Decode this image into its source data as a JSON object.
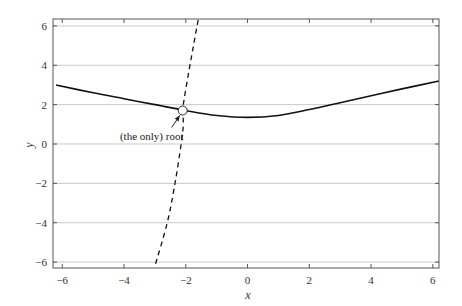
{
  "chart_data": {
    "type": "line",
    "title": "",
    "xlabel": "x",
    "ylabel": "y",
    "xlim": [
      -6.3,
      6.2
    ],
    "ylim": [
      -6.3,
      6.35
    ],
    "xticks": [
      -6,
      -4,
      -2,
      0,
      2,
      4,
      6
    ],
    "yticks": [
      -6,
      -4,
      -2,
      0,
      2,
      4,
      6
    ],
    "xtick_labels": [
      "−6",
      "−4",
      "−2",
      "0",
      "2",
      "4",
      "6"
    ],
    "ytick_labels": [
      "−6",
      "−4",
      "−2",
      "0",
      "2",
      "4",
      "6"
    ],
    "grid": {
      "horizontal": true,
      "vertical": false
    },
    "legend": null,
    "series": [
      {
        "name": "solid curve",
        "style": "solid",
        "x": [
          -6.2,
          -5,
          -4,
          -3,
          -2,
          -1,
          0,
          1,
          2,
          3,
          4,
          5,
          6.2
        ],
        "y": [
          3.0,
          2.6,
          2.3,
          2.0,
          1.7,
          1.45,
          1.35,
          1.45,
          1.75,
          2.1,
          2.45,
          2.8,
          3.2
        ]
      },
      {
        "name": "dashed curve",
        "style": "dashed",
        "x": [
          -1.6,
          -1.75,
          -1.9,
          -2.05,
          -2.1,
          -2.08,
          -2.15,
          -2.35,
          -2.6,
          -3.0
        ],
        "y": [
          6.3,
          5.0,
          3.7,
          2.3,
          1.7,
          1.0,
          0.0,
          -2.0,
          -4.0,
          -6.2
        ]
      }
    ],
    "annotations": [
      {
        "text": "(the only) root",
        "x": -2.1,
        "y": 1.7,
        "marker": "open-circle",
        "arrow": true
      }
    ]
  },
  "labels": {
    "xlabel": "x",
    "ylabel": "y",
    "annotation": "(the only) root",
    "xticks": [
      "−6",
      "−4",
      "−2",
      "0",
      "2",
      "4",
      "6"
    ],
    "yticks": [
      "6",
      "4",
      "2",
      "0",
      "−2",
      "−4",
      "−6"
    ]
  }
}
